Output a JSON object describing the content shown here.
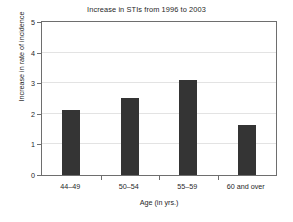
{
  "chart_data": {
    "type": "bar",
    "title": "Increase in STIs from 1996 to 2003",
    "xlabel": "Age (in yrs.)",
    "ylabel": "Increase in rate of incidence",
    "categories": [
      "44–49",
      "50–54",
      "55–59",
      "60 and over"
    ],
    "values": [
      2.12,
      2.52,
      3.12,
      1.65
    ],
    "series": [
      {
        "name": "Increase in rate of incidence",
        "values": [
          2.12,
          2.52,
          3.12,
          1.65
        ]
      }
    ],
    "ylim": [
      0,
      5
    ],
    "xlim": [
      0,
      4
    ],
    "ytick_labels": [
      "0",
      "1",
      "2",
      "3",
      "4",
      "5"
    ],
    "ytick_values": [
      0,
      1,
      2,
      3,
      4,
      5
    ],
    "grid": true,
    "grid_axis": "y",
    "legend": false,
    "legend_position": "none",
    "bar_color": "#343434",
    "grid_color": "#e3e3e3",
    "axis_color": "#6e6e6e",
    "background_color": "#ffffff",
    "text_color": "#1f1f1f"
  }
}
